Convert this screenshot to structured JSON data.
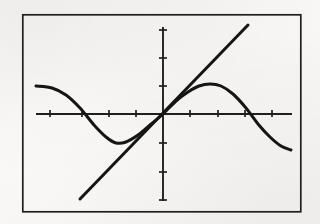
{
  "figure": {
    "background_color": "#f6f5f3",
    "ink_color": "#1a1a1a",
    "frame": {
      "label": "plot-frame",
      "x": 22,
      "y": 14,
      "width": 279,
      "height": 198,
      "stroke_width": 1.6
    }
  },
  "chart_data": {
    "type": "line",
    "title": "",
    "xlabel": "",
    "ylabel": "",
    "grid": false,
    "legend": "none",
    "axes": {
      "origin_px": [
        163,
        114
      ],
      "x_axis": {
        "label": "x-axis",
        "y_px": 114,
        "x_start_px": 36,
        "x_end_px": 292,
        "tick_spacing_px": 27,
        "tick_length_px": 7,
        "ticks_px": [
          50,
          82,
          109,
          136,
          190,
          218,
          245,
          272
        ]
      },
      "y_axis": {
        "label": "y-axis",
        "x_px": 163,
        "y_top_px": 27,
        "y_bottom_px": 201,
        "tick_spacing_px": 29,
        "tick_length_px": 7,
        "ticks_px": [
          30,
          58,
          86,
          143,
          172,
          200
        ]
      },
      "xlim": [
        -4.7,
        4.8
      ],
      "ylim": [
        -3.0,
        3.0
      ]
    },
    "series": [
      {
        "name": "sine-curve",
        "type": "curve",
        "stroke_width": 3.0,
        "description": "smooth sinusoid, descends from left, trough left of origin, rises through origin, crest right of origin, descends to right",
        "points_px": [
          [
            36,
            86
          ],
          [
            52,
            88
          ],
          [
            66,
            95
          ],
          [
            80,
            108
          ],
          [
            94,
            125
          ],
          [
            106,
            137
          ],
          [
            116,
            143
          ],
          [
            126,
            142
          ],
          [
            138,
            135
          ],
          [
            150,
            125
          ],
          [
            163,
            114
          ],
          [
            176,
            101
          ],
          [
            188,
            92
          ],
          [
            199,
            86
          ],
          [
            210,
            84
          ],
          [
            221,
            86
          ],
          [
            233,
            94
          ],
          [
            246,
            108
          ],
          [
            258,
            124
          ],
          [
            270,
            137
          ],
          [
            281,
            146
          ],
          [
            291,
            150
          ]
        ],
        "points_data": [
          [
            -4.7,
            1.04
          ],
          [
            -4.11,
            0.97
          ],
          [
            -3.59,
            0.66
          ],
          [
            -3.07,
            0.21
          ],
          [
            -2.56,
            -0.41
          ],
          [
            -2.11,
            -0.84
          ],
          [
            -1.74,
            -1.06
          ],
          [
            -1.37,
            -1.02
          ],
          [
            -0.93,
            -0.77
          ],
          [
            -0.48,
            -0.41
          ],
          [
            0.0,
            0.0
          ],
          [
            0.48,
            0.47
          ],
          [
            0.93,
            0.8
          ],
          [
            1.33,
            1.02
          ],
          [
            1.74,
            1.09
          ],
          [
            2.15,
            1.02
          ],
          [
            2.59,
            0.72
          ],
          [
            3.07,
            0.21
          ],
          [
            3.52,
            -0.36
          ],
          [
            3.96,
            -0.84
          ],
          [
            4.37,
            -1.15
          ],
          [
            4.74,
            -1.29
          ]
        ]
      },
      {
        "name": "straight-line",
        "type": "line",
        "stroke_width": 3.0,
        "description": "straight line of positive slope passing through the origin",
        "start_px": [
          80,
          199
        ],
        "end_px": [
          248,
          25
        ],
        "start_data": [
          -3.07,
          -3.01
        ],
        "end_data": [
          3.15,
          3.07
        ],
        "slope": 1.0,
        "intercept": 0.0
      }
    ]
  }
}
